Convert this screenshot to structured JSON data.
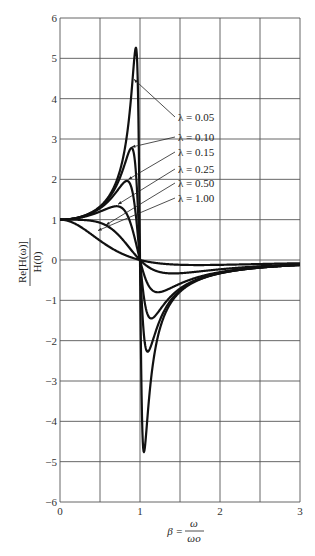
{
  "chart_data": {
    "type": "line",
    "title": "",
    "xlabel": "β = ω/ωo",
    "ylabel": "Re[H(ω)] / H(0)",
    "xlim": [
      0,
      3
    ],
    "ylim": [
      -6,
      6
    ],
    "grid": true,
    "x_ticks": [
      0,
      0.5,
      1,
      1.5,
      2,
      2.5,
      3
    ],
    "x_tick_labels": [
      "0",
      "",
      "1",
      "",
      "2",
      "",
      "3"
    ],
    "y_ticks": [
      -6,
      -5,
      -4,
      -3,
      -2,
      -1,
      0,
      1,
      2,
      3,
      4,
      5,
      6
    ],
    "y_tick_labels": [
      "−6",
      "−5",
      "−4",
      "−3",
      "−2",
      "−1",
      "0",
      "1",
      "2",
      "3",
      "4",
      "5",
      "6"
    ],
    "x": [
      0,
      0.2,
      0.4,
      0.6,
      0.7,
      0.8,
      0.85,
      0.9,
      0.93,
      0.95,
      0.97,
      1.0,
      1.03,
      1.05,
      1.07,
      1.1,
      1.15,
      1.2,
      1.3,
      1.5,
      1.75,
      2.0,
      2.5,
      3.0
    ],
    "series": [
      {
        "name": "λ = 0.05",
        "lambda": 0.05,
        "values": [
          1.0,
          1.04,
          1.19,
          1.55,
          1.93,
          2.7,
          3.4,
          4.43,
          4.99,
          5.13,
          4.13,
          0.0,
          -4.19,
          -4.81,
          -4.57,
          -3.74,
          -2.7,
          -2.04,
          -1.39,
          -0.8,
          -0.48,
          -0.33,
          -0.19,
          -0.12
        ]
      },
      {
        "name": "λ = 0.10",
        "lambda": 0.1,
        "values": [
          1.0,
          1.04,
          1.18,
          1.51,
          1.84,
          2.36,
          2.64,
          2.73,
          2.52,
          2.24,
          1.66,
          0.0,
          -1.56,
          -2.21,
          -2.53,
          -2.65,
          -2.25,
          -1.8,
          -1.3,
          -0.78,
          -0.48,
          -0.33,
          -0.19,
          -0.12
        ]
      },
      {
        "name": "λ = 0.15",
        "lambda": 0.15,
        "values": [
          1.0,
          1.04,
          1.18,
          1.45,
          1.68,
          1.91,
          1.88,
          1.72,
          1.5,
          1.31,
          0.96,
          0.0,
          -0.88,
          -1.28,
          -1.55,
          -1.81,
          -1.76,
          -1.52,
          -1.18,
          -0.75,
          -0.47,
          -0.33,
          -0.19,
          -0.12
        ]
      },
      {
        "name": "λ = 0.25",
        "lambda": 0.25,
        "values": [
          1.0,
          1.03,
          1.14,
          1.31,
          1.33,
          1.26,
          1.13,
          0.94,
          0.76,
          0.64,
          0.44,
          0.0,
          -0.4,
          -0.6,
          -0.75,
          -0.93,
          -1.06,
          -1.05,
          -0.93,
          -0.67,
          -0.45,
          -0.32,
          -0.19,
          -0.12
        ]
      },
      {
        "name": "λ = 0.50",
        "lambda": 0.5,
        "values": [
          1.0,
          0.99,
          0.92,
          0.77,
          0.63,
          0.48,
          0.38,
          0.26,
          0.18,
          0.13,
          0.08,
          0.0,
          -0.08,
          -0.13,
          -0.17,
          -0.22,
          -0.3,
          -0.36,
          -0.42,
          -0.44,
          -0.37,
          -0.3,
          -0.18,
          -0.11
        ]
      },
      {
        "name": "λ = 1.00",
        "lambda": 1.0,
        "values": [
          1.0,
          0.92,
          0.74,
          0.47,
          0.34,
          0.22,
          0.16,
          0.1,
          0.07,
          0.05,
          0.03,
          0.0,
          -0.03,
          -0.05,
          -0.07,
          -0.09,
          -0.13,
          -0.16,
          -0.21,
          -0.28,
          -0.32,
          -0.3,
          -0.21,
          -0.14
        ]
      }
    ],
    "annotations": [
      {
        "text": "λ = 0.05",
        "label_xy": [
          178,
          121
        ],
        "arrow_to": [
          1.0,
          0.0
        ]
      },
      {
        "text": "λ = 0.10",
        "label_xy": [
          178,
          141
        ],
        "arrow_to": [
          0.0,
          0.0
        ]
      },
      {
        "text": "λ = 0.15",
        "label_xy": [
          178,
          156
        ],
        "arrow_to": [
          0.0,
          0.0
        ]
      },
      {
        "text": "λ = 0.25",
        "label_xy": [
          178,
          173
        ],
        "arrow_to": [
          0.0,
          0.0
        ]
      },
      {
        "text": "λ = 0.50",
        "label_xy": [
          178,
          187
        ],
        "arrow_to": [
          0.0,
          0.0
        ]
      },
      {
        "text": "λ = 1.00",
        "label_xy": [
          178,
          202
        ],
        "arrow_to": [
          0.0,
          0.0
        ]
      }
    ],
    "legend_position": "inline annotations upper-right of peak"
  },
  "labels": {
    "ylabel_num": "Re[H(ω)]",
    "ylabel_den": "H(0)",
    "xlabel_lhs": "β =",
    "xlabel_num": "ω",
    "xlabel_den": "ωo"
  }
}
